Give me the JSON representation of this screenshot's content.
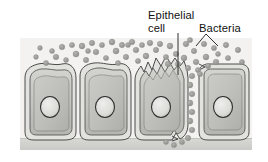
{
  "figure": {
    "panel": {
      "background_color": "#f3f2f0",
      "x": 20,
      "y": 38,
      "width": 232,
      "height": 112
    },
    "labels": [
      {
        "id": "epithelial-cell",
        "line1": "Epithelial",
        "line2": "cell",
        "x": 148,
        "y1": 15,
        "y2": 29,
        "leader": {
          "type": "straight",
          "x1": 178,
          "y1": 33,
          "x2": 178,
          "y2": 75
        }
      },
      {
        "id": "bacteria",
        "line1": "Bacteria",
        "line2": "",
        "x": 199,
        "y1": 29,
        "y2": 0,
        "leader": {
          "type": "diagonal",
          "x1": 205,
          "y1": 34,
          "x2": 190,
          "y2": 48
        }
      }
    ],
    "colors": {
      "panel_bg": "#f3f2f0",
      "bacteria_fill": "#9b9b99",
      "bacteria_fill_light": "#adadaa",
      "cell_outline": "#3a3a3a",
      "cell_cytoplasm": "#c9c9c6",
      "cell_cytoplasm_inner": "#bcbcb8",
      "cell_membrane_band": "#dedeDB",
      "nucleus_fill": "#dcdcd9",
      "nucleus_outline": "#2e2e2e",
      "basement_membrane": "#d2d2cf",
      "label_text": "#111111",
      "leader_line": "#1a1a1a"
    },
    "cells": [
      {
        "id": "cell-1",
        "x": 24,
        "width": 52,
        "nucleus_cx": 50,
        "nucleus_cy": 107,
        "top_style": "wavy"
      },
      {
        "id": "cell-2",
        "x": 79,
        "width": 52,
        "nucleus_cx": 105,
        "nucleus_cy": 107,
        "top_style": "wavy"
      },
      {
        "id": "cell-3",
        "x": 134,
        "width": 52,
        "nucleus_cx": 160,
        "nucleus_cy": 107,
        "top_style": "ruffled"
      },
      {
        "id": "cell-4",
        "x": 198,
        "width": 50,
        "nucleus_cx": 223,
        "nucleus_cy": 107,
        "top_style": "flat"
      }
    ],
    "bacteria": {
      "count_top_field": 52,
      "count_invading_column": 12,
      "radius_range": [
        2.2,
        3.4
      ],
      "top_field": [
        [
          46,
          63,
          2.6
        ],
        [
          56,
          57,
          2.8
        ],
        [
          66,
          60,
          2.5
        ],
        [
          76,
          54,
          3.0
        ],
        [
          86,
          60,
          2.7
        ],
        [
          96,
          52,
          2.8
        ],
        [
          106,
          58,
          2.6
        ],
        [
          116,
          51,
          3.0
        ],
        [
          126,
          57,
          2.7
        ],
        [
          136,
          50,
          2.8
        ],
        [
          52,
          51,
          2.5
        ],
        [
          62,
          47,
          2.8
        ],
        [
          72,
          45,
          2.6
        ],
        [
          82,
          46,
          2.9
        ],
        [
          92,
          43,
          2.7
        ],
        [
          102,
          45,
          2.6
        ],
        [
          112,
          42,
          2.9
        ],
        [
          122,
          45,
          2.7
        ],
        [
          132,
          42,
          2.8
        ],
        [
          142,
          45,
          2.6
        ],
        [
          146,
          56,
          2.9
        ],
        [
          156,
          50,
          2.7
        ],
        [
          166,
          57,
          2.6
        ],
        [
          150,
          43,
          2.8
        ],
        [
          160,
          44,
          2.7
        ],
        [
          170,
          46,
          2.9
        ],
        [
          176,
          54,
          2.7
        ],
        [
          186,
          44,
          2.8
        ],
        [
          184,
          58,
          2.9
        ],
        [
          194,
          51,
          2.7
        ],
        [
          196,
          62,
          2.8
        ],
        [
          204,
          44,
          2.7
        ],
        [
          206,
          57,
          2.9
        ],
        [
          214,
          48,
          2.6
        ],
        [
          216,
          62,
          2.8
        ],
        [
          226,
          45,
          2.7
        ],
        [
          228,
          58,
          2.6
        ],
        [
          238,
          50,
          2.7
        ],
        [
          242,
          62,
          2.6
        ],
        [
          36,
          57,
          2.4
        ],
        [
          40,
          48,
          2.4
        ],
        [
          88,
          51,
          2.5
        ],
        [
          118,
          63,
          2.6
        ],
        [
          128,
          45,
          2.5
        ],
        [
          138,
          61,
          2.6
        ],
        [
          168,
          64,
          2.7
        ],
        [
          178,
          64,
          2.6
        ],
        [
          188,
          68,
          2.7
        ],
        [
          198,
          70,
          2.6
        ],
        [
          208,
          66,
          2.7
        ],
        [
          190,
          40,
          2.6
        ],
        [
          218,
          54,
          2.5
        ]
      ],
      "invading_column": [
        [
          192,
          76,
          2.8
        ],
        [
          190,
          85,
          2.9
        ],
        [
          192,
          94,
          2.8
        ],
        [
          190,
          103,
          2.9
        ],
        [
          192,
          112,
          2.8
        ],
        [
          190,
          121,
          2.9
        ],
        [
          192,
          130,
          2.8
        ],
        [
          188,
          138,
          2.7
        ],
        [
          182,
          142,
          2.6
        ],
        [
          174,
          145,
          2.6
        ],
        [
          166,
          142,
          2.5
        ],
        [
          200,
          74,
          2.6
        ]
      ]
    },
    "basement_membrane": {
      "x": 20,
      "y": 138,
      "width": 232,
      "height": 12
    }
  }
}
